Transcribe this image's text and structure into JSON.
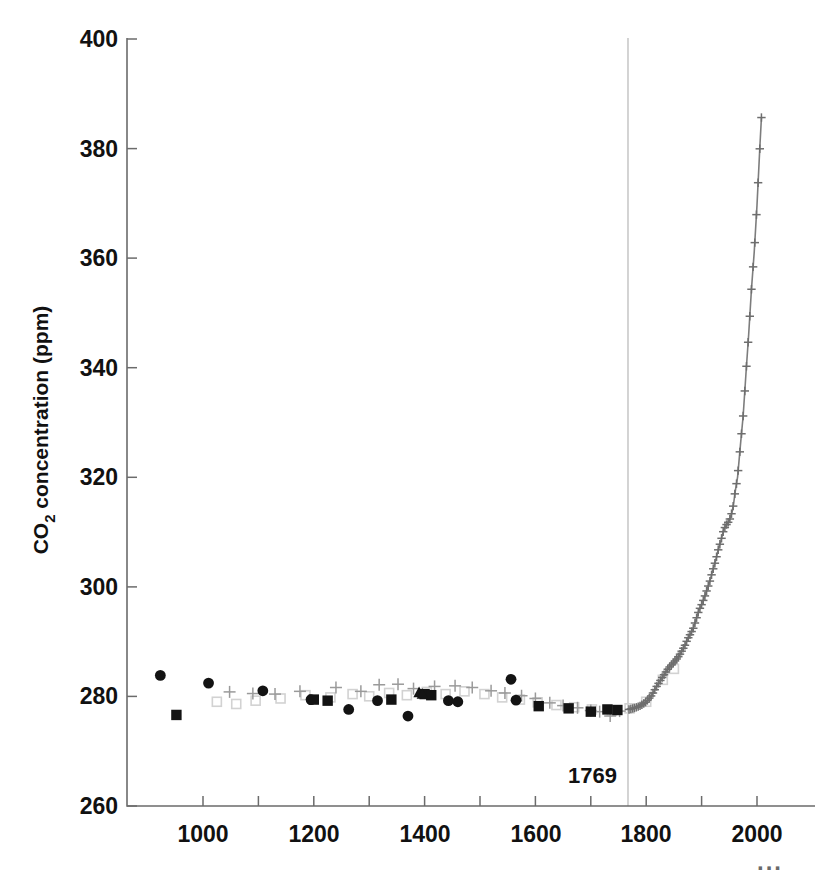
{
  "chart_data": {
    "type": "scatter",
    "title": "",
    "xlabel": "",
    "ylabel": "CO₂ concentration (ppm)",
    "ylabel_main": "concentration (ppm)",
    "ylabel_sub": "2",
    "ylabel_prefix": "CO",
    "xlim": [
      900,
      2010
    ],
    "ylim": [
      260,
      400
    ],
    "grid": false,
    "legend": false,
    "y_ticks": [
      260,
      280,
      300,
      320,
      340,
      360,
      380,
      400
    ],
    "y_ticklabels": [
      "260",
      "280",
      "300",
      "320",
      "340",
      "360",
      "380",
      "400"
    ],
    "x_ticks": [
      1000,
      1100,
      1200,
      1300,
      1400,
      1500,
      1600,
      1700,
      1800,
      1900,
      2000
    ],
    "x_ticklabels_major": [
      "1000",
      "1200",
      "1400",
      "1600",
      "1800",
      "2000"
    ],
    "x_major_values": [
      1000,
      1200,
      1400,
      1600,
      1800,
      2000
    ],
    "annotations": [
      {
        "text": "1769",
        "x": 1740,
        "y": 266,
        "kind": "vline-label"
      },
      {
        "text": "...",
        "x": 2000,
        "y": 252,
        "kind": "axis-continuation"
      }
    ],
    "vertical_line": {
      "x": 1769,
      "color": "#c9c9c9",
      "label": "1769"
    },
    "series": [
      {
        "name": "ice-core-filled-circles",
        "marker": "circle",
        "color": "#131313",
        "points": [
          [
            923,
            283.8
          ],
          [
            1010,
            282.4
          ],
          [
            1108,
            281.0
          ],
          [
            1195,
            279.4
          ],
          [
            1263,
            277.6
          ],
          [
            1315,
            279.2
          ],
          [
            1370,
            276.4
          ],
          [
            1443,
            279.2
          ],
          [
            1460,
            279.0
          ],
          [
            1556,
            283.1
          ],
          [
            1565,
            279.3
          ]
        ]
      },
      {
        "name": "ice-core-filled-squares",
        "marker": "square",
        "color": "#131313",
        "points": [
          [
            952,
            276.6
          ],
          [
            1200,
            279.4
          ],
          [
            1225,
            279.2
          ],
          [
            1340,
            279.4
          ],
          [
            1400,
            280.4
          ],
          [
            1412,
            280.2
          ],
          [
            1606,
            278.2
          ],
          [
            1660,
            277.8
          ],
          [
            1700,
            277.2
          ],
          [
            1730,
            277.6
          ],
          [
            1748,
            277.5
          ]
        ]
      },
      {
        "name": "ice-core-filled-triangles",
        "marker": "triangle",
        "color": "#131313",
        "points": [
          [
            1390,
            280.8
          ],
          [
            1396,
            280.5
          ]
        ]
      },
      {
        "name": "ice-core-gray-plus",
        "marker": "plus",
        "color": "#9a9a9a",
        "points": [
          [
            1048,
            280.8
          ],
          [
            1090,
            280.5
          ],
          [
            1130,
            280.4
          ],
          [
            1175,
            280.9
          ],
          [
            1240,
            281.6
          ],
          [
            1285,
            280.9
          ],
          [
            1318,
            282.1
          ],
          [
            1352,
            282.2
          ],
          [
            1380,
            281.4
          ],
          [
            1418,
            281.8
          ],
          [
            1455,
            281.9
          ],
          [
            1486,
            281.6
          ],
          [
            1520,
            281.0
          ],
          [
            1545,
            280.6
          ],
          [
            1575,
            280.1
          ],
          [
            1600,
            279.6
          ],
          [
            1626,
            278.8
          ],
          [
            1650,
            278.3
          ],
          [
            1676,
            277.9
          ],
          [
            1700,
            277.4
          ],
          [
            1716,
            277.2
          ],
          [
            1735,
            276.4
          ],
          [
            1752,
            277.3
          ]
        ]
      },
      {
        "name": "ice-core-open-squares",
        "marker": "open-square",
        "color": "#d2d2d2",
        "points": [
          [
            1025,
            279.0
          ],
          [
            1060,
            278.6
          ],
          [
            1095,
            279.2
          ],
          [
            1140,
            279.6
          ],
          [
            1185,
            280.2
          ],
          [
            1230,
            279.8
          ],
          [
            1270,
            280.4
          ],
          [
            1300,
            280.0
          ],
          [
            1336,
            280.6
          ],
          [
            1368,
            280.2
          ],
          [
            1404,
            280.8
          ],
          [
            1438,
            280.4
          ],
          [
            1472,
            280.9
          ],
          [
            1508,
            280.4
          ],
          [
            1540,
            279.8
          ],
          [
            1572,
            279.4
          ],
          [
            1604,
            278.9
          ],
          [
            1638,
            278.4
          ],
          [
            1670,
            278.0
          ],
          [
            1702,
            277.6
          ],
          [
            1738,
            277.4
          ],
          [
            1770,
            277.8
          ],
          [
            1800,
            279.0
          ],
          [
            1830,
            283.0
          ],
          [
            1850,
            285.0
          ]
        ]
      },
      {
        "name": "modern-record",
        "marker": "plus-line",
        "color": "#6e6e6e",
        "points": [
          [
            1769,
            277.6
          ],
          [
            1780,
            277.9
          ],
          [
            1790,
            278.3
          ],
          [
            1800,
            279.0
          ],
          [
            1810,
            280.2
          ],
          [
            1820,
            282.0
          ],
          [
            1830,
            283.6
          ],
          [
            1840,
            285.1
          ],
          [
            1850,
            286.2
          ],
          [
            1855,
            286.8
          ],
          [
            1860,
            287.5
          ],
          [
            1865,
            288.4
          ],
          [
            1870,
            289.3
          ],
          [
            1875,
            290.5
          ],
          [
            1880,
            291.4
          ],
          [
            1885,
            292.4
          ],
          [
            1890,
            294.0
          ],
          [
            1895,
            295.6
          ],
          [
            1900,
            296.7
          ],
          [
            1905,
            298.0
          ],
          [
            1910,
            299.5
          ],
          [
            1915,
            301.0
          ],
          [
            1920,
            302.9
          ],
          [
            1925,
            304.6
          ],
          [
            1930,
            306.7
          ],
          [
            1935,
            308.4
          ],
          [
            1940,
            310.4
          ],
          [
            1945,
            311.3
          ],
          [
            1950,
            312.0
          ],
          [
            1955,
            313.6
          ],
          [
            1958,
            315.2
          ],
          [
            1960,
            316.9
          ],
          [
            1965,
            320.0
          ],
          [
            1970,
            325.7
          ],
          [
            1975,
            331.1
          ],
          [
            1980,
            338.7
          ],
          [
            1985,
            346.0
          ],
          [
            1990,
            354.2
          ],
          [
            1995,
            361.0
          ],
          [
            2000,
            369.5
          ],
          [
            2005,
            379.8
          ],
          [
            2008,
            385.5
          ]
        ]
      }
    ]
  },
  "axes": {
    "y_axis_name": "co2-concentration-axis",
    "x_axis_name": "year-axis"
  }
}
